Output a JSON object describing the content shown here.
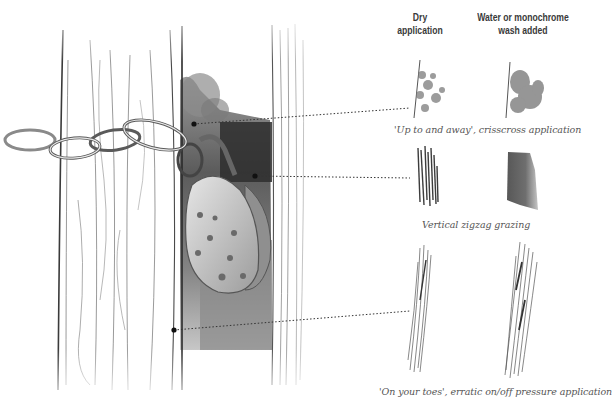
{
  "headers": {
    "dry": [
      "Dry",
      "application"
    ],
    "wash": [
      "Water or monochrome",
      "wash added"
    ]
  },
  "techniques": [
    {
      "caption": "'Up to and away', crisscross application"
    },
    {
      "caption": "Vertical zigzag grazing"
    },
    {
      "caption": "'On your toes', erratic on/off pressure application"
    }
  ],
  "illustration": {
    "subject": "Chain and padlock on wooden gate post",
    "callout_points": 3
  },
  "colors": {
    "ink": "#3a3a3a",
    "graphite_dark": "#2b2b2b",
    "graphite_mid": "#7a7a7a",
    "graphite_light": "#c8c8c8"
  }
}
